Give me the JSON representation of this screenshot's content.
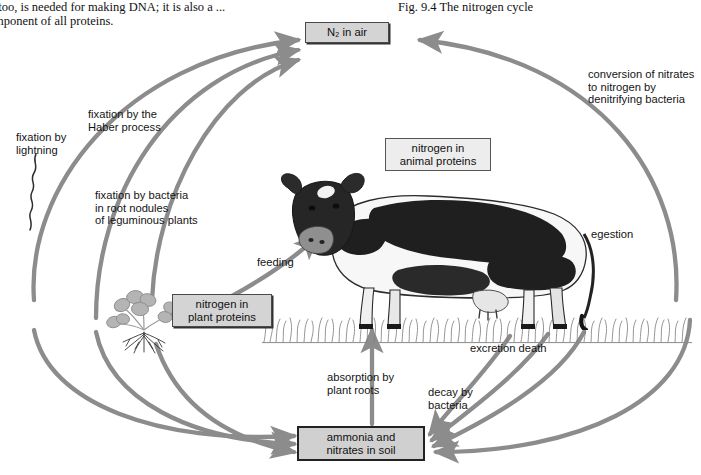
{
  "page": {
    "body_text_line1": "trogen, too, is needed for making DNA; it is also a ...",
    "body_text_line2": "mponent of all proteins.",
    "figure_caption_fragment": "Fig. 9.4   The nitrogen cycle"
  },
  "diagram": {
    "title": "The nitrogen cycle",
    "accent_arrow_color": "#8c8c8c",
    "boxes": [
      {
        "id": "n2-air",
        "label_line1": "N₂ in air",
        "label_line2": "",
        "style": "grey"
      },
      {
        "id": "animal-proteins",
        "label_line1": "nitrogen in",
        "label_line2": "animal proteins",
        "style": "light"
      },
      {
        "id": "plant-proteins",
        "label_line1": "nitrogen in",
        "label_line2": "plant proteins",
        "style": "grey"
      },
      {
        "id": "soil",
        "label_line1": "ammonia and",
        "label_line2": "nitrates in soil",
        "style": "soil"
      }
    ],
    "process_labels": {
      "lightning": {
        "line1": "fixation by",
        "line2": "lightning",
        "line3": ""
      },
      "haber": {
        "line1": "fixation by the",
        "line2": "Haber process",
        "line3": ""
      },
      "legume_bacteria": {
        "line1": "fixation by bacteria",
        "line2": "in root nodules",
        "line3": "of leguminous plants"
      },
      "denitrifying": {
        "line1": "conversion of nitrates",
        "line2": "to nitrogen by",
        "line3": "denitrifying bacteria"
      },
      "feeding": {
        "line1": "feeding",
        "line2": "",
        "line3": ""
      },
      "egestion": {
        "line1": "egestion",
        "line2": "",
        "line3": ""
      },
      "excretion_death": {
        "line1": "excretion   death",
        "line2": "",
        "line3": ""
      },
      "absorption": {
        "line1": "absorption by",
        "line2": "plant roots",
        "line3": ""
      },
      "decay": {
        "line1": "decay by",
        "line2": "bacteria",
        "line3": ""
      }
    },
    "illustrations": {
      "cow": "dairy-cow-illustration",
      "plant": "clover-legume-plant-illustration",
      "lightning_bolt": "lightning-bolt-icon",
      "grass": "grass-strip-illustration"
    }
  }
}
